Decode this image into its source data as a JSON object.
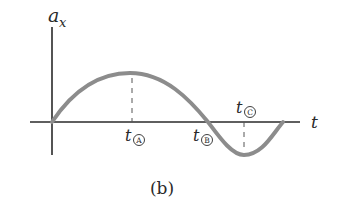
{
  "figure": {
    "caption": "(b)",
    "y_axis_label": "a",
    "y_axis_subscript": "x",
    "x_axis_label": "t",
    "markers": [
      {
        "label": "t",
        "circled": "A",
        "meaning": "maximum"
      },
      {
        "label": "t",
        "circled": "B",
        "meaning": "zero crossing"
      },
      {
        "label": "t",
        "circled": "C",
        "meaning": "minimum"
      }
    ],
    "colors": {
      "axis": "#2a2a2a",
      "curve": "#8c8c8c",
      "dash": "#555555"
    }
  }
}
